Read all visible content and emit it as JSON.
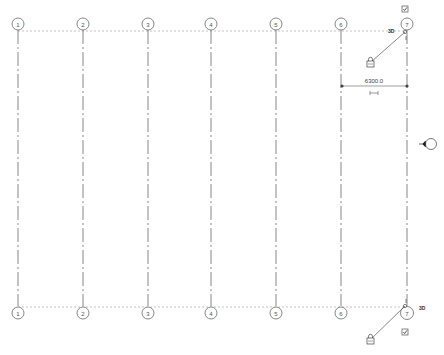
{
  "view": {
    "type": "revit-grid-plan",
    "background": "#ffffff",
    "line_color": "#6a6a6a",
    "extent_line_color": "#b5b5b5"
  },
  "grids": [
    {
      "label": "1",
      "x": 18
    },
    {
      "label": "2",
      "x": 83
    },
    {
      "label": "3",
      "x": 148
    },
    {
      "label": "4",
      "x": 211
    },
    {
      "label": "5",
      "x": 276
    },
    {
      "label": "6",
      "x": 341
    },
    {
      "label": "7",
      "x": 407
    }
  ],
  "top_bubbles_y": 24,
  "bottom_bubbles_y": 312,
  "top_extent_y": 31,
  "bottom_extent_y": 307,
  "annotations": {
    "top_3d_tag": "3D",
    "bottom_3d_tag": "3D",
    "dimension_value": "6300.0"
  },
  "icons": {
    "top_checkbox": "checked-visibility-icon",
    "bottom_checkbox": "checked-visibility-icon",
    "top_lock": "lock-icon",
    "bottom_lock": "lock-icon",
    "elevation_marker": "elevation-marker-icon",
    "dimension_toggle": "dimension-equality-icon"
  }
}
